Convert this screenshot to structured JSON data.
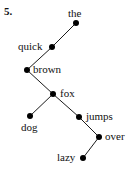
{
  "figure": {
    "number_label": "5.",
    "width": 129,
    "height": 175,
    "background_color": "#ffffff",
    "ink_color": "#000000",
    "text_color": "#111111"
  },
  "chart_data": {
    "type": "scatter",
    "title": "",
    "xlabel": "",
    "ylabel": "",
    "xlim": [
      0,
      129
    ],
    "ylim": [
      175,
      0
    ],
    "grid": false,
    "legend": null,
    "nodes": [
      {
        "id": "the",
        "label": "the",
        "x": 76,
        "y": 23,
        "label_x": 68,
        "label_y": 8,
        "label_side": "above"
      },
      {
        "id": "quick",
        "label": "quick",
        "x": 52,
        "y": 47,
        "label_x": 18,
        "label_y": 41,
        "label_side": "left"
      },
      {
        "id": "brown",
        "label": "brown",
        "x": 27,
        "y": 70,
        "label_x": 33,
        "label_y": 64,
        "label_side": "right"
      },
      {
        "id": "fox",
        "label": "fox",
        "x": 53,
        "y": 94,
        "label_x": 60,
        "label_y": 88,
        "label_side": "right"
      },
      {
        "id": "dog",
        "label": "dog",
        "x": 30,
        "y": 116,
        "label_x": 21,
        "label_y": 122,
        "label_side": "below"
      },
      {
        "id": "jumps",
        "label": "jumps",
        "x": 79,
        "y": 117,
        "label_x": 86,
        "label_y": 111,
        "label_side": "right"
      },
      {
        "id": "over",
        "label": "over",
        "x": 99,
        "y": 137,
        "label_x": 105,
        "label_y": 131,
        "label_side": "right"
      },
      {
        "id": "lazy",
        "label": "lazy",
        "x": 83,
        "y": 158,
        "label_x": 57,
        "label_y": 152,
        "label_side": "left"
      }
    ],
    "edges": [
      {
        "from": "the",
        "to": "quick"
      },
      {
        "from": "quick",
        "to": "brown"
      },
      {
        "from": "brown",
        "to": "fox"
      },
      {
        "from": "fox",
        "to": "dog"
      },
      {
        "from": "fox",
        "to": "jumps"
      },
      {
        "from": "jumps",
        "to": "over"
      },
      {
        "from": "over",
        "to": "lazy"
      }
    ]
  }
}
